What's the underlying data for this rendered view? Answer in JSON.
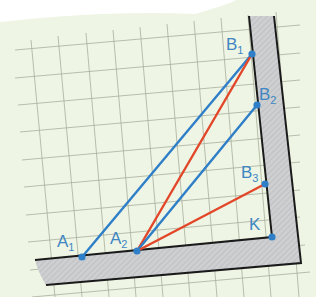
{
  "colors": {
    "paper": "#eef5e4",
    "grid": "#a9ae9c",
    "wall_fill": "#c9cbcd",
    "wall_edge": "#1a1a1a",
    "blue": "#2f7fc8",
    "red": "#e2472a",
    "label": "#3f86c2"
  },
  "points": {
    "B1": {
      "label": "B",
      "sub": "1",
      "x": 252,
      "y": 54
    },
    "B2": {
      "label": "B",
      "sub": "2",
      "x": 257,
      "y": 105
    },
    "B3": {
      "label": "B",
      "sub": "3",
      "x": 265,
      "y": 184
    },
    "K": {
      "label": "K",
      "sub": "",
      "x": 272,
      "y": 237
    },
    "A1": {
      "label": "A",
      "sub": "1",
      "x": 82,
      "y": 257
    },
    "A2": {
      "label": "A",
      "sub": "2",
      "x": 137,
      "y": 251
    }
  },
  "segments": [
    {
      "from": "A1",
      "to": "B1",
      "color": "blue"
    },
    {
      "from": "A2",
      "to": "B1",
      "color": "red"
    },
    {
      "from": "A2",
      "to": "B2",
      "color": "blue"
    },
    {
      "from": "A2",
      "to": "B3",
      "color": "red"
    }
  ]
}
